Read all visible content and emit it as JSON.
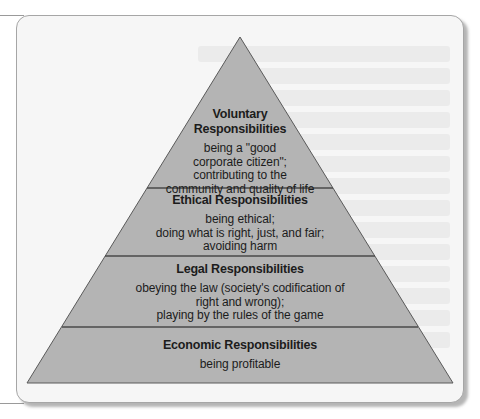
{
  "figure": {
    "type": "pyramid",
    "colors": {
      "pyramid_fill": "#b4b4b4",
      "pyramid_stroke": "#5a5a5a",
      "card_background": "#f6f6f6",
      "card_border": "#a6a6a6",
      "text": "#1c1c1c"
    },
    "levels": [
      {
        "position": "top",
        "title_line1": "Voluntary",
        "title_line2": "Responsibilities",
        "desc_line1": "being a \"good",
        "desc_line2": "corporate citizen\";",
        "desc_line3": "contributing to the",
        "desc_line4": "community and quality of life"
      },
      {
        "position": "second",
        "title_line1": "Ethical Responsibilities",
        "desc_line1": "being ethical;",
        "desc_line2": "doing what is right, just, and fair;",
        "desc_line3": "avoiding harm"
      },
      {
        "position": "third",
        "title_line1": "Legal Responsibilities",
        "desc_line1": "obeying the law (society's codification of",
        "desc_line2": "right and wrong);",
        "desc_line3": "playing by the rules of the game"
      },
      {
        "position": "base",
        "title_line1": "Economic Responsibilities",
        "desc_line1": "being profitable"
      }
    ]
  }
}
